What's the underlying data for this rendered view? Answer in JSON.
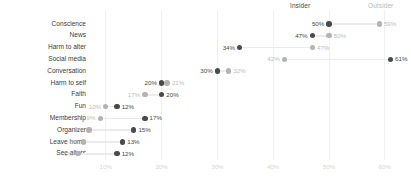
{
  "chart_data": {
    "type": "scatter",
    "subtype": "dumbbell",
    "title": "",
    "xlabel": "",
    "ylabel": "",
    "xlim": [
      0,
      65
    ],
    "grid": true,
    "legend_position": "top-right",
    "xticks": [
      "10%",
      "20%",
      "30%",
      "40%",
      "50%",
      "60%"
    ],
    "xtick_values": [
      10,
      20,
      30,
      40,
      50,
      60
    ],
    "categories": [
      "Conscience",
      "News",
      "Harm to alter",
      "Social media",
      "Conversation",
      "Harm to self",
      "Faith",
      "Fun",
      "Membership",
      "Organizer",
      "Leave home",
      "See alters"
    ],
    "series": [
      {
        "name": "Insider",
        "color": "#4a4a4a",
        "values": [
          50,
          47,
          34,
          61,
          30,
          20,
          20,
          12,
          17,
          15,
          13,
          12
        ],
        "labels": [
          "50%",
          "47%",
          "34%",
          "61%",
          "30%",
          "20%",
          "20%",
          "12%",
          "17%",
          "15%",
          "13%",
          "12%"
        ]
      },
      {
        "name": "Outsider",
        "color": "#b3b3b3",
        "values": [
          59,
          50,
          47,
          42,
          32,
          21,
          17,
          10,
          9,
          7,
          6,
          5
        ],
        "labels": [
          "59%",
          "50%",
          "47%",
          "42%",
          "32%",
          "21%",
          "17%",
          "10%",
          "9%",
          "7%",
          "6%",
          "5%"
        ]
      }
    ]
  },
  "legend": {
    "insider": "Insider",
    "outsider": "Outsider"
  }
}
